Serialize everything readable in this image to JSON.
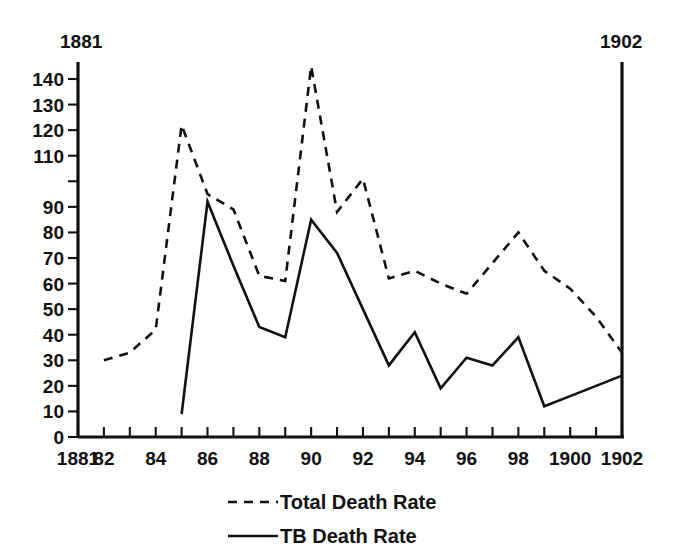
{
  "corner_labels": {
    "left": "1881",
    "right": "1902"
  },
  "legend": {
    "entries": [
      {
        "label": "Total Death Rate",
        "style": "dashed",
        "icon": "dashed-line-icon"
      },
      {
        "label": "TB   Death Rate",
        "style": "solid",
        "icon": "solid-line-icon"
      }
    ]
  },
  "axes": {
    "y_tick_labels": [
      "140",
      "130",
      "120",
      "110",
      "",
      "90",
      "80",
      "70",
      "60",
      "50",
      "40",
      "30",
      "20",
      "10",
      "0"
    ],
    "y_tick_values": [
      140,
      130,
      120,
      110,
      100,
      90,
      80,
      70,
      60,
      50,
      40,
      30,
      20,
      10,
      0
    ],
    "x_tick_years": [
      1881,
      1882,
      1883,
      1884,
      1885,
      1886,
      1887,
      1888,
      1889,
      1890,
      1891,
      1892,
      1893,
      1894,
      1895,
      1896,
      1897,
      1898,
      1899,
      1900,
      1901,
      1902
    ],
    "x_tick_labels": [
      "1881",
      "82",
      "",
      "84",
      "",
      "86",
      "",
      "88",
      "",
      "90",
      "",
      "92",
      "",
      "94",
      "",
      "96",
      "",
      "98",
      "",
      "1900",
      "",
      "1902"
    ]
  },
  "colors": {
    "ink": "#111111",
    "background": "#ffffff"
  },
  "chart_data": {
    "type": "line",
    "title": "",
    "subtitle": "",
    "xlabel": "",
    "ylabel": "",
    "xlim": [
      1881,
      1902
    ],
    "ylim": [
      0,
      145
    ],
    "grid": false,
    "legend_position": "bottom",
    "x": [
      1881,
      1882,
      1883,
      1884,
      1885,
      1886,
      1887,
      1888,
      1889,
      1890,
      1891,
      1892,
      1893,
      1894,
      1895,
      1896,
      1897,
      1898,
      1899,
      1900,
      1901,
      1902
    ],
    "series": [
      {
        "name": "Total Death Rate",
        "style": "dashed",
        "x": [
          1882,
          1883,
          1884,
          1885,
          1886,
          1887,
          1888,
          1889,
          1890,
          1891,
          1892,
          1893,
          1894,
          1895,
          1896,
          1897,
          1898,
          1899,
          1900,
          1901,
          1902
        ],
        "values": [
          30,
          33,
          42,
          122,
          95,
          89,
          63,
          61,
          145,
          88,
          101,
          62,
          65,
          60,
          56,
          68,
          80,
          65,
          58,
          47,
          33
        ]
      },
      {
        "name": "TB   Death Rate",
        "style": "solid",
        "x": [
          1885,
          1886,
          1887,
          1888,
          1889,
          1890,
          1891,
          1892,
          1893,
          1894,
          1895,
          1896,
          1897,
          1898,
          1899,
          1900,
          1901,
          1902
        ],
        "values": [
          9,
          92,
          67,
          43,
          39,
          85,
          72,
          50,
          28,
          41,
          19,
          31,
          28,
          39,
          12,
          16,
          20,
          24
        ]
      }
    ]
  }
}
